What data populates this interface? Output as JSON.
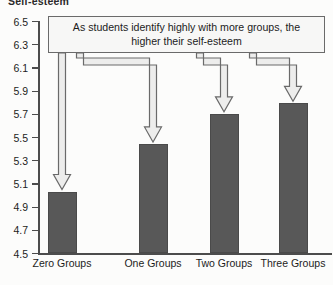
{
  "chart_data": {
    "type": "bar",
    "title": "",
    "xlabel": "",
    "ylabel": "Self-esteem",
    "categories": [
      "Zero Groups",
      "One Groups",
      "Two Groups",
      "Three Groups"
    ],
    "values": [
      5.03,
      5.44,
      5.7,
      5.79
    ],
    "ylim": [
      4.5,
      6.5
    ],
    "ytick_step": 0.2,
    "yticks": [
      "6.5",
      "6.3",
      "6.1",
      "5.9",
      "5.7",
      "5.5",
      "5.3",
      "5.1",
      "4.9",
      "4.7",
      "4.5"
    ],
    "grid": false,
    "legend": "none",
    "bar_color": "#585858",
    "annotations": [
      {
        "text": "As students identify highly with more groups, the higher their self-esteem",
        "arrows_to": [
          "Zero Groups",
          "One Groups",
          "Two Groups",
          "Three Groups"
        ]
      }
    ]
  },
  "axis": {
    "y_title_cropped": "Self-esteem"
  },
  "annotation": {
    "text": "As students identify highly with more groups, the higher their self-esteem"
  },
  "colors": {
    "bar": "#585858",
    "axis": "#4c4c4c",
    "arrow_fill": "#ededec",
    "arrow_stroke": "#6a6a6a",
    "background": "#fcfcfb"
  }
}
